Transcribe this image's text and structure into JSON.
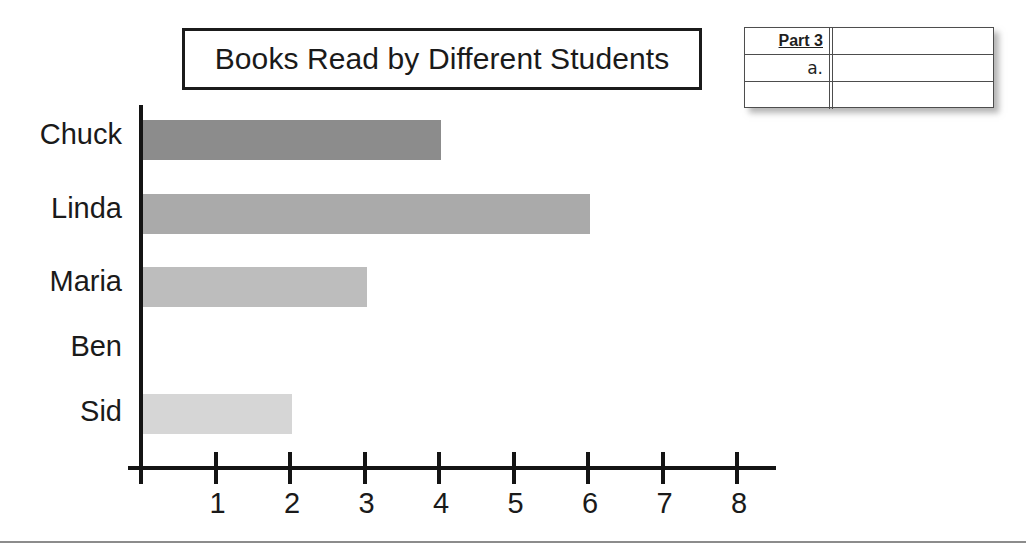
{
  "title": {
    "text": "Books Read by Different Students"
  },
  "chart_data": {
    "type": "bar",
    "orientation": "horizontal",
    "title": "Books Read by Different Students",
    "xlabel": "",
    "ylabel": "",
    "categories": [
      "Chuck",
      "Linda",
      "Maria",
      "Ben",
      "Sid"
    ],
    "values": [
      4,
      6,
      3,
      0,
      2
    ],
    "bar_colors": [
      "#8c8c8c",
      "#aaaaaa",
      "#bdbdbd",
      "#cccccc",
      "#d6d6d6"
    ],
    "xlim": [
      0,
      8
    ],
    "x_ticks": [
      0,
      1,
      2,
      3,
      4,
      5,
      6,
      7,
      8
    ],
    "x_tick_labels": [
      "",
      "1",
      "2",
      "3",
      "4",
      "5",
      "6",
      "7",
      "8"
    ],
    "grid": false,
    "legend": "none"
  },
  "answer_table": {
    "rows": [
      {
        "label": "Part 3",
        "style": "bold-underline",
        "answer": ""
      },
      {
        "label": "a.",
        "style": "plain",
        "answer": ""
      },
      {
        "label": "",
        "style": "plain",
        "answer": ""
      }
    ]
  }
}
